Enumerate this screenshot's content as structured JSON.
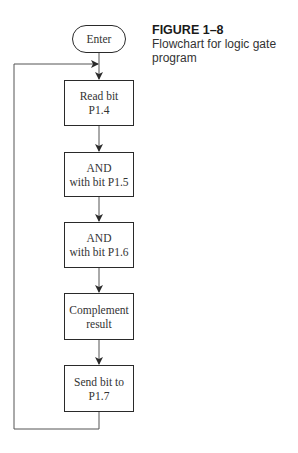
{
  "caption": {
    "figure_label": "FIGURE 1–8",
    "description": "Flowchart for logic gate program"
  },
  "flowchart": {
    "start": {
      "label": "Enter",
      "shape": "terminal"
    },
    "steps": [
      {
        "line1": "Read bit",
        "line2": "P1.4"
      },
      {
        "line1": "AND",
        "line2": "with bit P1.5"
      },
      {
        "line1": "AND",
        "line2": "with bit P1.6"
      },
      {
        "line1": "Complement",
        "line2": "result"
      },
      {
        "line1": "Send bit to",
        "line2": "P1.7"
      }
    ],
    "loop": "Send bit to P1.7 returns to Read bit P1.4",
    "stroke_color": "#2a2a2a"
  }
}
